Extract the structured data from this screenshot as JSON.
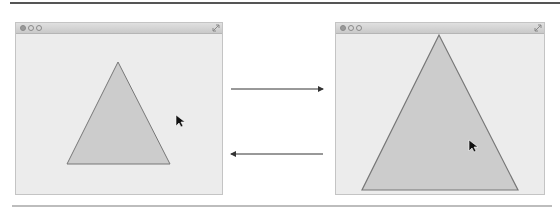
{
  "diagram": {
    "colors": {
      "window_bg": "#ececec",
      "triangle_fill": "#cccccc",
      "triangle_stroke": "#777777",
      "arrow": "#333333",
      "cursor": "#111111"
    },
    "windows": [
      {
        "name": "small-window",
        "traffic_lights": [
          "close",
          "minimize",
          "zoom"
        ],
        "triangle": {
          "apex": [
            118,
            62
          ],
          "base_left": [
            67,
            164
          ],
          "base_right": [
            170,
            164
          ]
        },
        "cursor": [
          176,
          115
        ]
      },
      {
        "name": "large-window",
        "traffic_lights": [
          "close",
          "minimize",
          "zoom"
        ],
        "triangle": {
          "apex": [
            439,
            35
          ],
          "base_left": [
            362,
            190
          ],
          "base_right": [
            518,
            190
          ]
        },
        "cursor": [
          469,
          140
        ]
      }
    ],
    "arrows": [
      {
        "direction": "right",
        "y": 89,
        "x1": 231,
        "x2": 323
      },
      {
        "direction": "left",
        "y": 154,
        "x1": 231,
        "x2": 323
      }
    ]
  }
}
